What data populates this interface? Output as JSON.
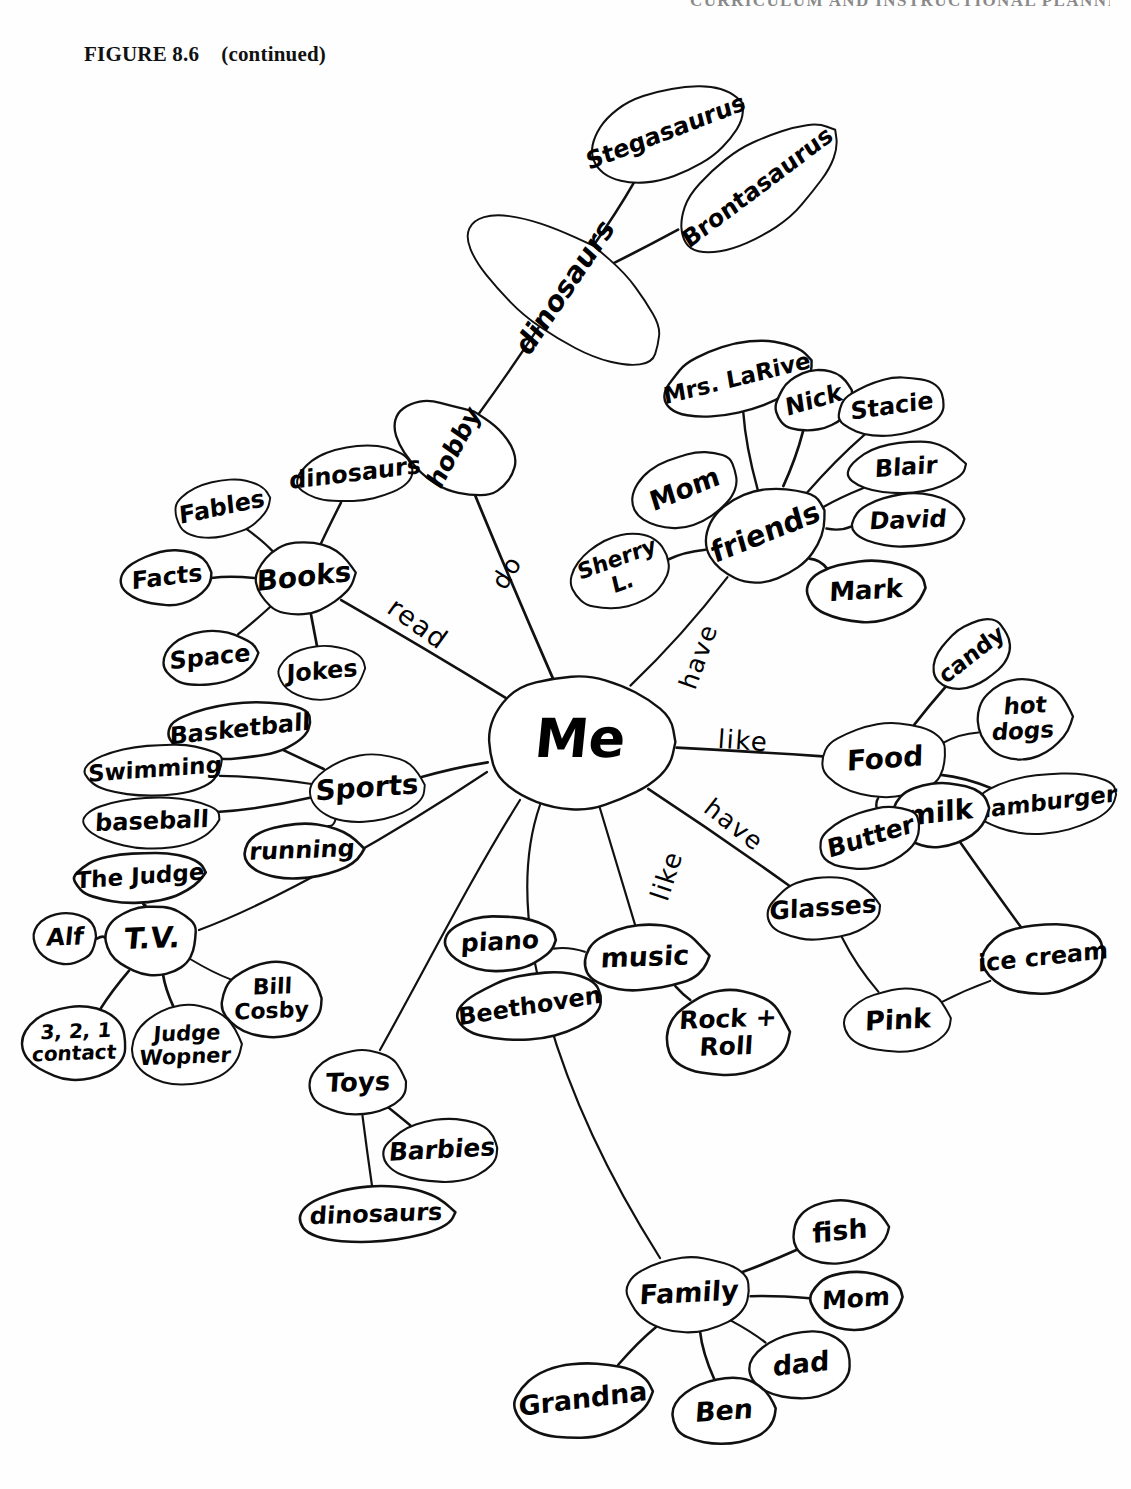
{
  "page": {
    "running_head": "CURRICULUM AND INSTRUCTIONAL PLANNING",
    "figure_number": "FIGURE 8.6",
    "figure_note": "(continued)"
  },
  "diagram": {
    "type": "mind-map",
    "title": "Me",
    "ink_color": "#111111",
    "paper_color": "#ffffff",
    "center": {
      "id": "me",
      "label": "Me",
      "x": 580,
      "y": 742,
      "rx": 97,
      "ry": 66,
      "font_size": 54
    },
    "nodes": [
      {
        "id": "hobby",
        "label": "hobby",
        "x": 455,
        "y": 448,
        "rx": 40,
        "ry": 66,
        "rot": -62,
        "font_size": 25
      },
      {
        "id": "dinosaurs_h",
        "label": "dinosaurs",
        "x": 566,
        "y": 288,
        "rx": 48,
        "ry": 113,
        "rot": -56,
        "font_size": 28
      },
      {
        "id": "stegasaurus",
        "label": "Stegasaurus",
        "x": 666,
        "y": 133,
        "rx": 82,
        "ry": 43,
        "rot": -21,
        "font_size": 24
      },
      {
        "id": "brontasaurus",
        "label": "Brontasaurus",
        "x": 758,
        "y": 188,
        "rx": 95,
        "ry": 42,
        "rot": -37,
        "font_size": 24
      },
      {
        "id": "books",
        "label": "Books",
        "x": 304,
        "y": 578,
        "rx": 50,
        "ry": 36,
        "rot": -6,
        "font_size": 28
      },
      {
        "id": "fables",
        "label": "Fables",
        "x": 222,
        "y": 508,
        "rx": 50,
        "ry": 28,
        "rot": -12,
        "font_size": 24
      },
      {
        "id": "facts",
        "label": "Facts",
        "x": 167,
        "y": 578,
        "rx": 45,
        "ry": 28,
        "rot": -7,
        "font_size": 24
      },
      {
        "id": "space",
        "label": "Space",
        "x": 210,
        "y": 658,
        "rx": 48,
        "ry": 27,
        "rot": -6,
        "font_size": 24
      },
      {
        "id": "jokes",
        "label": "Jokes",
        "x": 322,
        "y": 672,
        "rx": 44,
        "ry": 27,
        "rot": -5,
        "font_size": 24
      },
      {
        "id": "dinosaurs_b",
        "label": "dinosaurs",
        "x": 355,
        "y": 474,
        "rx": 58,
        "ry": 28,
        "rot": -7,
        "font_size": 24
      },
      {
        "id": "sports",
        "label": "Sports",
        "x": 367,
        "y": 789,
        "rx": 57,
        "ry": 34,
        "rot": -4,
        "font_size": 28
      },
      {
        "id": "basketball",
        "label": "Basketball",
        "x": 240,
        "y": 730,
        "rx": 74,
        "ry": 28,
        "rot": -6,
        "font_size": 24
      },
      {
        "id": "swimming",
        "label": "Swimming",
        "x": 155,
        "y": 770,
        "rx": 70,
        "ry": 26,
        "rot": -4,
        "font_size": 23
      },
      {
        "id": "baseball",
        "label": "baseball",
        "x": 152,
        "y": 822,
        "rx": 68,
        "ry": 26,
        "rot": -2,
        "font_size": 24
      },
      {
        "id": "running",
        "label": "running",
        "x": 302,
        "y": 851,
        "rx": 60,
        "ry": 27,
        "rot": -2,
        "font_size": 24
      },
      {
        "id": "tv",
        "label": "T.V.",
        "x": 152,
        "y": 940,
        "rx": 46,
        "ry": 35,
        "rot": -2,
        "font_size": 29
      },
      {
        "id": "thejudge",
        "label": "The Judge",
        "x": 140,
        "y": 877,
        "rx": 67,
        "ry": 25,
        "rot": -4,
        "font_size": 23
      },
      {
        "id": "alf",
        "label": "Alf",
        "x": 65,
        "y": 938,
        "rx": 32,
        "ry": 26,
        "rot": -2,
        "font_size": 24
      },
      {
        "id": "contact321",
        "label": "3, 2, 1\ncontact",
        "x": 75,
        "y": 1043,
        "rx": 52,
        "ry": 38,
        "rot": -2,
        "font_size": 20
      },
      {
        "id": "judgewopner",
        "label": "Judge\nWopner",
        "x": 186,
        "y": 1046,
        "rx": 55,
        "ry": 41,
        "rot": -2,
        "font_size": 21
      },
      {
        "id": "billcosby",
        "label": "Bill\nCosby",
        "x": 272,
        "y": 1000,
        "rx": 50,
        "ry": 38,
        "rot": -2,
        "font_size": 22
      },
      {
        "id": "toys",
        "label": "Toys",
        "x": 358,
        "y": 1083,
        "rx": 48,
        "ry": 33,
        "rot": -2,
        "font_size": 26
      },
      {
        "id": "barbies",
        "label": "Barbies",
        "x": 442,
        "y": 1151,
        "rx": 57,
        "ry": 32,
        "rot": -3,
        "font_size": 25
      },
      {
        "id": "dinosaurs_t",
        "label": "dinosaurs",
        "x": 376,
        "y": 1215,
        "rx": 78,
        "ry": 28,
        "rot": -2,
        "font_size": 24
      },
      {
        "id": "music",
        "label": "music",
        "x": 645,
        "y": 958,
        "rx": 62,
        "ry": 33,
        "rot": -2,
        "font_size": 27
      },
      {
        "id": "piano",
        "label": "piano",
        "x": 500,
        "y": 943,
        "rx": 56,
        "ry": 28,
        "rot": -3,
        "font_size": 25
      },
      {
        "id": "beethoven",
        "label": "Beethoven",
        "x": 530,
        "y": 1007,
        "rx": 72,
        "ry": 33,
        "rot": -9,
        "font_size": 24
      },
      {
        "id": "rockroll",
        "label": "Rock +\nRoll",
        "x": 727,
        "y": 1034,
        "rx": 62,
        "ry": 43,
        "rot": -2,
        "font_size": 25
      },
      {
        "id": "friends",
        "label": "friends",
        "x": 766,
        "y": 534,
        "rx": 63,
        "ry": 45,
        "rot": -22,
        "font_size": 29
      },
      {
        "id": "mrslarive",
        "label": "Mrs. LaRive",
        "x": 737,
        "y": 379,
        "rx": 76,
        "ry": 34,
        "rot": -14,
        "font_size": 23
      },
      {
        "id": "nick",
        "label": "Nick",
        "x": 814,
        "y": 401,
        "rx": 39,
        "ry": 30,
        "rot": -16,
        "font_size": 24
      },
      {
        "id": "stacie",
        "label": "Stacie",
        "x": 892,
        "y": 407,
        "rx": 53,
        "ry": 29,
        "rot": -8,
        "font_size": 24
      },
      {
        "id": "blair",
        "label": "Blair",
        "x": 906,
        "y": 468,
        "rx": 58,
        "ry": 26,
        "rot": -4,
        "font_size": 24
      },
      {
        "id": "david",
        "label": "David",
        "x": 908,
        "y": 521,
        "rx": 56,
        "ry": 27,
        "rot": -2,
        "font_size": 24
      },
      {
        "id": "mark",
        "label": "Mark",
        "x": 866,
        "y": 591,
        "rx": 60,
        "ry": 31,
        "rot": -3,
        "font_size": 26
      },
      {
        "id": "mom_f",
        "label": "Mom",
        "x": 685,
        "y": 490,
        "rx": 56,
        "ry": 35,
        "rot": -22,
        "font_size": 27
      },
      {
        "id": "sherry",
        "label": "Sherry\nL.",
        "x": 620,
        "y": 572,
        "rx": 50,
        "ry": 36,
        "rot": -20,
        "font_size": 22
      },
      {
        "id": "food",
        "label": "Food",
        "x": 885,
        "y": 760,
        "rx": 63,
        "ry": 38,
        "rot": -4,
        "font_size": 28
      },
      {
        "id": "candy",
        "label": "candy",
        "x": 972,
        "y": 655,
        "rx": 43,
        "ry": 29,
        "rot": -38,
        "font_size": 23
      },
      {
        "id": "hotdogs",
        "label": "hot\ndogs",
        "x": 1024,
        "y": 719,
        "rx": 48,
        "ry": 40,
        "rot": -3,
        "font_size": 23
      },
      {
        "id": "hamburger",
        "label": "hamburger",
        "x": 1046,
        "y": 803,
        "rx": 72,
        "ry": 30,
        "rot": -7,
        "font_size": 23
      },
      {
        "id": "milk",
        "label": "milk",
        "x": 940,
        "y": 814,
        "rx": 50,
        "ry": 32,
        "rot": -7,
        "font_size": 28
      },
      {
        "id": "butter",
        "label": "Butter",
        "x": 871,
        "y": 838,
        "rx": 52,
        "ry": 29,
        "rot": -17,
        "font_size": 25
      },
      {
        "id": "icecream",
        "label": "ice cream",
        "x": 1043,
        "y": 958,
        "rx": 63,
        "ry": 35,
        "rot": -6,
        "font_size": 24
      },
      {
        "id": "pink",
        "label": "Pink",
        "x": 898,
        "y": 1021,
        "rx": 53,
        "ry": 32,
        "rot": -3,
        "font_size": 27
      },
      {
        "id": "glasses",
        "label": "Glasses",
        "x": 823,
        "y": 909,
        "rx": 56,
        "ry": 31,
        "rot": -4,
        "font_size": 25
      },
      {
        "id": "family",
        "label": "Family",
        "x": 689,
        "y": 1294,
        "rx": 62,
        "ry": 38,
        "rot": -3,
        "font_size": 27
      },
      {
        "id": "fish",
        "label": "fish",
        "x": 840,
        "y": 1232,
        "rx": 49,
        "ry": 32,
        "rot": -6,
        "font_size": 27
      },
      {
        "id": "mom_fam",
        "label": "Mom",
        "x": 856,
        "y": 1300,
        "rx": 47,
        "ry": 29,
        "rot": -4,
        "font_size": 25
      },
      {
        "id": "dad",
        "label": "dad",
        "x": 801,
        "y": 1365,
        "rx": 51,
        "ry": 34,
        "rot": -6,
        "font_size": 27
      },
      {
        "id": "ben",
        "label": "Ben",
        "x": 724,
        "y": 1412,
        "rx": 52,
        "ry": 34,
        "rot": -4,
        "font_size": 27
      },
      {
        "id": "grandna",
        "label": "Grandna",
        "x": 583,
        "y": 1400,
        "rx": 70,
        "ry": 37,
        "rot": -7,
        "font_size": 27
      }
    ],
    "edges": [
      {
        "from": "me",
        "to": "hobby",
        "label": "do",
        "label_x": 508,
        "label_y": 573,
        "label_rot": -58,
        "label_size": 25
      },
      {
        "from": "hobby",
        "to": "dinosaurs_h",
        "label": ""
      },
      {
        "from": "dinosaurs_h",
        "to": "stegasaurus",
        "label": ""
      },
      {
        "from": "dinosaurs_h",
        "to": "brontasaurus",
        "label": ""
      },
      {
        "from": "hobby",
        "to": "dinosaurs_b",
        "label": ""
      },
      {
        "from": "me",
        "to": "books",
        "label": "read",
        "label_x": 417,
        "label_y": 625,
        "label_rot": 36,
        "label_size": 27
      },
      {
        "from": "books",
        "to": "fables",
        "label": ""
      },
      {
        "from": "books",
        "to": "facts",
        "label": ""
      },
      {
        "from": "books",
        "to": "space",
        "label": ""
      },
      {
        "from": "books",
        "to": "jokes",
        "label": ""
      },
      {
        "from": "books",
        "to": "dinosaurs_b",
        "label": ""
      },
      {
        "from": "me",
        "to": "sports",
        "label": ""
      },
      {
        "from": "sports",
        "to": "basketball",
        "label": ""
      },
      {
        "from": "sports",
        "to": "swimming",
        "label": ""
      },
      {
        "from": "sports",
        "to": "baseball",
        "label": ""
      },
      {
        "from": "sports",
        "to": "running",
        "label": ""
      },
      {
        "from": "me",
        "to": "tv",
        "label": ""
      },
      {
        "from": "tv",
        "to": "thejudge",
        "label": ""
      },
      {
        "from": "tv",
        "to": "alf",
        "label": ""
      },
      {
        "from": "tv",
        "to": "contact321",
        "label": ""
      },
      {
        "from": "tv",
        "to": "judgewopner",
        "label": ""
      },
      {
        "from": "tv",
        "to": "billcosby",
        "label": ""
      },
      {
        "from": "me",
        "to": "toys",
        "label": ""
      },
      {
        "from": "toys",
        "to": "barbies",
        "label": ""
      },
      {
        "from": "toys",
        "to": "dinosaurs_t",
        "label": ""
      },
      {
        "from": "me",
        "to": "music",
        "label": "like",
        "label_x": 668,
        "label_y": 876,
        "label_rot": -72,
        "label_size": 26
      },
      {
        "from": "music",
        "to": "piano",
        "label": ""
      },
      {
        "from": "music",
        "to": "beethoven",
        "label": ""
      },
      {
        "from": "music",
        "to": "rockroll",
        "label": ""
      },
      {
        "from": "me",
        "to": "friends",
        "label": "have",
        "label_x": 700,
        "label_y": 657,
        "label_rot": -70,
        "label_size": 25
      },
      {
        "from": "friends",
        "to": "mrslarive",
        "label": ""
      },
      {
        "from": "friends",
        "to": "nick",
        "label": ""
      },
      {
        "from": "friends",
        "to": "stacie",
        "label": ""
      },
      {
        "from": "friends",
        "to": "blair",
        "label": ""
      },
      {
        "from": "friends",
        "to": "david",
        "label": ""
      },
      {
        "from": "friends",
        "to": "mark",
        "label": ""
      },
      {
        "from": "friends",
        "to": "mom_f",
        "label": ""
      },
      {
        "from": "friends",
        "to": "sherry",
        "label": ""
      },
      {
        "from": "me",
        "to": "food",
        "label": "like",
        "label_x": 743,
        "label_y": 742,
        "label_rot": 4,
        "label_size": 26
      },
      {
        "from": "food",
        "to": "candy",
        "label": ""
      },
      {
        "from": "food",
        "to": "hotdogs",
        "label": ""
      },
      {
        "from": "food",
        "to": "hamburger",
        "label": ""
      },
      {
        "from": "food",
        "to": "milk",
        "label": ""
      },
      {
        "from": "food",
        "to": "butter",
        "label": ""
      },
      {
        "from": "milk",
        "to": "icecream",
        "label": ""
      },
      {
        "from": "icecream",
        "to": "pink",
        "label": ""
      },
      {
        "from": "pink",
        "to": "glasses",
        "label": ""
      },
      {
        "from": "me",
        "to": "glasses",
        "label": "have",
        "label_x": 733,
        "label_y": 826,
        "label_rot": 38,
        "label_size": 25
      },
      {
        "from": "me",
        "to": "family",
        "label": ""
      },
      {
        "from": "family",
        "to": "fish",
        "label": ""
      },
      {
        "from": "family",
        "to": "mom_fam",
        "label": ""
      },
      {
        "from": "family",
        "to": "dad",
        "label": ""
      },
      {
        "from": "family",
        "to": "ben",
        "label": ""
      },
      {
        "from": "family",
        "to": "grandna",
        "label": ""
      }
    ],
    "curved_edges": [
      {
        "from": "me",
        "to": "toys",
        "path": "M 520 800 C 470 880, 430 960, 380 1050"
      },
      {
        "from": "me",
        "to": "family",
        "path": "M 540 805 C 500 920, 560 1100, 660 1258"
      },
      {
        "from": "me",
        "to": "tv",
        "path": "M 487 772 C 400 830, 280 900, 199 930"
      }
    ]
  }
}
